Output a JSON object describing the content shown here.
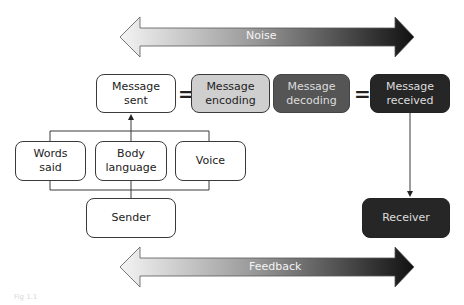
{
  "diagram": {
    "noise_arrow": {
      "label": "Noise"
    },
    "feedback_arrow": {
      "label": "Feedback"
    },
    "boxes": {
      "message_sent": "Message\nsent",
      "message_encoding": "Message\nencoding",
      "message_decoding": "Message\ndecoding",
      "message_received": "Message\nreceived",
      "words_said": "Words\nsaid",
      "body_language": "Body\nlanguage",
      "voice": "Voice",
      "sender": "Sender",
      "receiver": "Receiver"
    },
    "equals_1": "=",
    "equals_2": "=",
    "caption": "Fig 1.1"
  },
  "colors": {
    "white_box": "#ffffff",
    "encoding_box": "#cfcfcf",
    "decoding_box": "#555555",
    "received_box": "#262626",
    "line": "#3a3a3a"
  }
}
